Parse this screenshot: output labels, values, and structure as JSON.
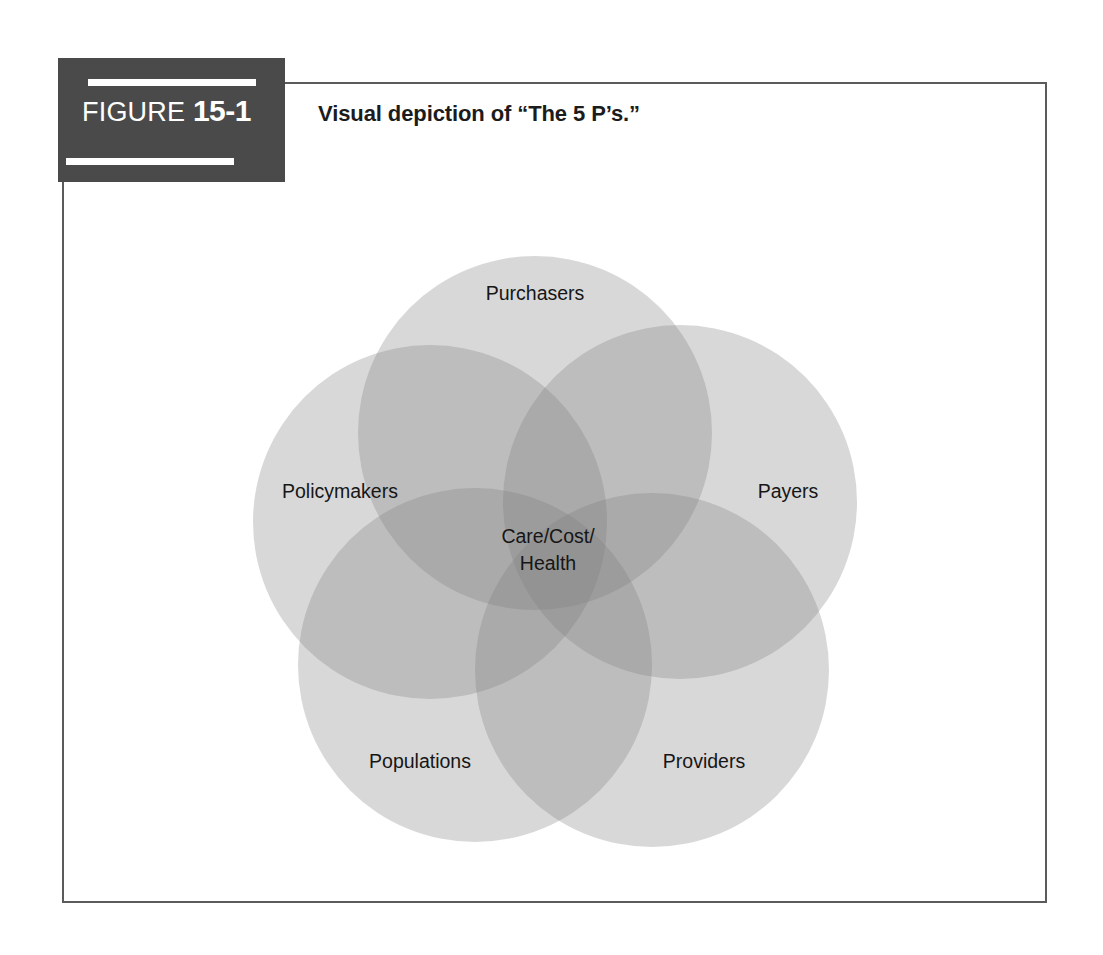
{
  "figure": {
    "tag_word": "FIGURE",
    "tag_number": "15-1",
    "caption": "Visual depiction of “The 5 P’s.”"
  },
  "diagram": {
    "type": "venn-5-circle",
    "center_label_line1": "Care/Cost/",
    "center_label_line2": "Health",
    "circles": [
      {
        "id": "purchasers",
        "label": "Purchasers",
        "position": "top",
        "fill": "#c3c3c3"
      },
      {
        "id": "payers",
        "label": "Payers",
        "position": "right",
        "fill": "#c9c9c9"
      },
      {
        "id": "providers",
        "label": "Providers",
        "position": "bottom-right",
        "fill": "#cfcfcf"
      },
      {
        "id": "populations",
        "label": "Populations",
        "position": "bottom-left",
        "fill": "#d6d6d6"
      },
      {
        "id": "policymakers",
        "label": "Policymakers",
        "position": "left",
        "fill": "#dcdcdc"
      }
    ]
  },
  "colors": {
    "tag_block": "#4a4a4a",
    "frame_border": "#5b5b5b",
    "text": "#1c1c1c",
    "page_background": "#ffffff"
  }
}
